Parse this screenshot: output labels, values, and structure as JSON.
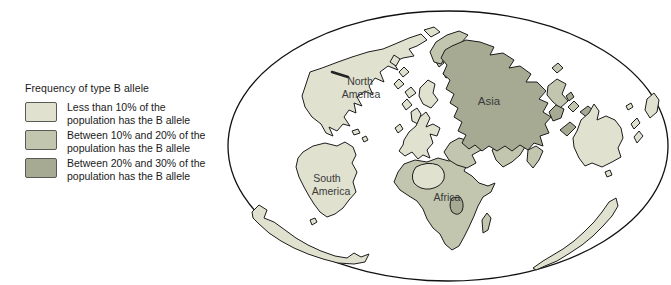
{
  "colors": {
    "light": "#e0e1cf",
    "medium": "#c3c6ae",
    "dark": "#a6aa93",
    "outline": "#1c1c1c",
    "ocean": "#ffffff",
    "label_text": "#3a3a3a"
  },
  "legend": {
    "title": "Frequency of type B allele",
    "items": [
      {
        "shade": "light",
        "line1": "Less than 10% of the",
        "line2": "population has the B allele"
      },
      {
        "shade": "medium",
        "line1": "Between 10% and 20% of the",
        "line2": "population has the B allele"
      },
      {
        "shade": "dark",
        "line1": "Between 20% and 30% of the",
        "line2": "population has the B allele"
      }
    ]
  },
  "map": {
    "labels": {
      "north_america": {
        "line1": "North",
        "line2": "America"
      },
      "south_america": {
        "line1": "South",
        "line2": "America"
      },
      "asia": "Asia",
      "africa": "Africa"
    }
  }
}
